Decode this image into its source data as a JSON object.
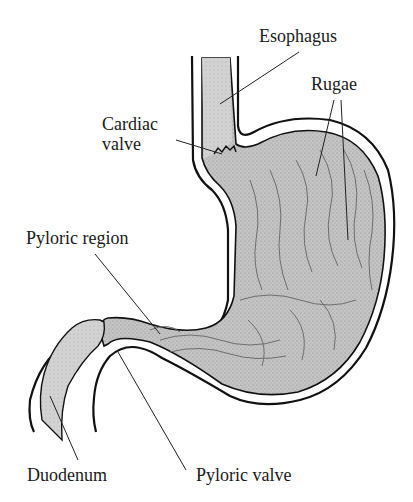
{
  "diagram": {
    "title": "",
    "colors": {
      "outline": "#111111",
      "fill": "#bdbdbd",
      "rugae": "#6e6e6e",
      "leader": "#222222",
      "background": "#ffffff"
    },
    "labels": [
      {
        "id": "esophagus",
        "text": "Esophagus"
      },
      {
        "id": "rugae",
        "text": "Rugae"
      },
      {
        "id": "cardiac-valve",
        "text": "Cardiac\nvalve"
      },
      {
        "id": "pyloric-region",
        "text": "Pyloric region"
      },
      {
        "id": "duodenum",
        "text": "Duodenum"
      },
      {
        "id": "pyloric-valve",
        "text": "Pyloric valve"
      }
    ]
  }
}
